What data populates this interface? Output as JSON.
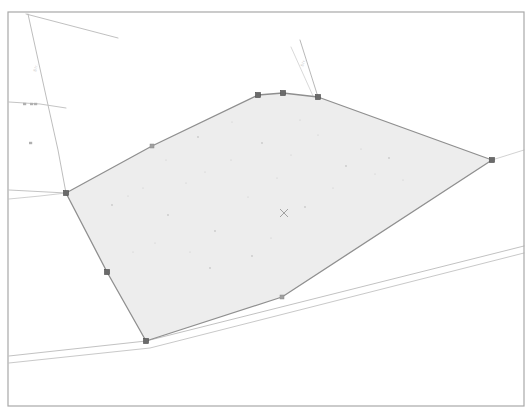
{
  "document": {
    "kind": "cadastral-parcel-map",
    "background_color": "#ffffff"
  },
  "frame": {
    "name": "map-border-frame",
    "x": 8,
    "y": 12,
    "width": 516,
    "height": 394,
    "stroke_color": "#a8a8a8",
    "stroke_width": 1.2
  },
  "parcel": {
    "name": "highlighted-parcel",
    "fill_color": "#ededed",
    "stroke_color": "#8f8f8f",
    "stroke_width": 1.3,
    "points": "66,193 152,146 258,95 283,93 318,97 492,160 282,297 146,341 107,272",
    "outline_points": [
      {
        "label": "west-corner",
        "x": 66,
        "y": 193
      },
      {
        "label": "northwest-mid",
        "x": 152,
        "y": 146
      },
      {
        "label": "north-left",
        "x": 258,
        "y": 95
      },
      {
        "label": "north-apex",
        "x": 283,
        "y": 93
      },
      {
        "label": "north-right",
        "x": 318,
        "y": 97
      },
      {
        "label": "east-corner",
        "x": 492,
        "y": 160
      },
      {
        "label": "southeast-mid",
        "x": 282,
        "y": 297
      },
      {
        "label": "south-corner",
        "x": 146,
        "y": 341
      },
      {
        "label": "southwest-mid",
        "x": 107,
        "y": 272
      }
    ],
    "vertex_marker": {
      "name": "parcel-vertex-handle",
      "size": 5,
      "fill_color": "#6b6b6b",
      "stroke_color": "#4a4a4a"
    },
    "major_vertices": [
      {
        "x": 66,
        "y": 193
      },
      {
        "x": 258,
        "y": 95
      },
      {
        "x": 283,
        "y": 93
      },
      {
        "x": 318,
        "y": 97
      },
      {
        "x": 492,
        "y": 160
      },
      {
        "x": 146,
        "y": 341
      },
      {
        "x": 107,
        "y": 272
      }
    ],
    "minor_vertices": [
      {
        "x": 152,
        "y": 146
      },
      {
        "x": 282,
        "y": 297
      }
    ]
  },
  "centroid_marker": {
    "name": "parcel-centroid-cross",
    "x": 284,
    "y": 213,
    "size": 4,
    "color": "#9a9a9a",
    "glyph": "x"
  },
  "roads": [
    {
      "name": "road-line-northwest-diagonal",
      "points": "26,14 118,38",
      "stroke_color": "#b9b9b9",
      "stroke_width": 0.9
    },
    {
      "name": "road-line-west-vertical",
      "points": "28,14 46,96 58,150 66,193",
      "stroke_color": "#b5b5b5",
      "stroke_width": 0.9
    },
    {
      "name": "road-line-west-branch",
      "points": "9,102 40,104 66,108",
      "stroke_color": "#bdbdbd",
      "stroke_width": 0.9
    },
    {
      "name": "road-line-west-lower",
      "points": "9,190 66,193",
      "stroke_color": "#bdbdbd",
      "stroke_width": 0.9
    },
    {
      "name": "road-line-west-spur",
      "points": "66,193 40,196 9,199",
      "stroke_color": "#c4c4c4",
      "stroke_width": 0.8
    },
    {
      "name": "road-line-north-tick",
      "points": "300,40 318,97",
      "stroke_color": "#b0b0b0",
      "stroke_width": 0.9
    },
    {
      "name": "road-line-north-tick-secondary",
      "points": "291,47 313,96",
      "stroke_color": "#c8c8c8",
      "stroke_width": 0.7
    },
    {
      "name": "road-edge-south-upper",
      "points": "9,356 146,341 524,246",
      "stroke_color": "#c2c2c2",
      "stroke_width": 1.0
    },
    {
      "name": "road-edge-south-lower",
      "points": "9,363 150,348 524,253",
      "stroke_color": "#c9c9c9",
      "stroke_width": 1.0
    },
    {
      "name": "road-line-right-edge-connector",
      "points": "492,160 524,150",
      "stroke_color": "#c6c6c6",
      "stroke_width": 0.8
    }
  ],
  "street_labels": [
    {
      "name": "street-label-west",
      "text": "Str.",
      "x": 36,
      "y": 72,
      "rotation": -76,
      "color": "#c0c0c0",
      "font_size": 4
    },
    {
      "name": "street-label-north",
      "text": "Str.",
      "x": 303,
      "y": 67,
      "rotation": -70,
      "color": "#c0c0c0",
      "font_size": 4
    }
  ],
  "tick_marks": [
    {
      "name": "tick-mark-west-a",
      "x": 23,
      "y": 104
    },
    {
      "name": "tick-mark-west-b",
      "x": 30,
      "y": 104
    },
    {
      "name": "tick-mark-west-c",
      "x": 34,
      "y": 104
    },
    {
      "name": "tick-mark-west-d",
      "x": 29,
      "y": 143
    }
  ],
  "speckles": [
    {
      "x": 112,
      "y": 205
    },
    {
      "x": 128,
      "y": 196
    },
    {
      "x": 143,
      "y": 188
    },
    {
      "x": 168,
      "y": 215
    },
    {
      "x": 186,
      "y": 183
    },
    {
      "x": 205,
      "y": 172
    },
    {
      "x": 215,
      "y": 231
    },
    {
      "x": 231,
      "y": 160
    },
    {
      "x": 248,
      "y": 197
    },
    {
      "x": 262,
      "y": 143
    },
    {
      "x": 277,
      "y": 178
    },
    {
      "x": 291,
      "y": 155
    },
    {
      "x": 305,
      "y": 207
    },
    {
      "x": 318,
      "y": 135
    },
    {
      "x": 333,
      "y": 188
    },
    {
      "x": 346,
      "y": 166
    },
    {
      "x": 361,
      "y": 149
    },
    {
      "x": 375,
      "y": 174
    },
    {
      "x": 389,
      "y": 158
    },
    {
      "x": 403,
      "y": 180
    },
    {
      "x": 190,
      "y": 252
    },
    {
      "x": 210,
      "y": 268
    },
    {
      "x": 155,
      "y": 243
    },
    {
      "x": 232,
      "y": 122
    },
    {
      "x": 198,
      "y": 137
    },
    {
      "x": 166,
      "y": 160
    },
    {
      "x": 133,
      "y": 252
    },
    {
      "x": 252,
      "y": 256
    },
    {
      "x": 271,
      "y": 238
    },
    {
      "x": 300,
      "y": 120
    }
  ]
}
